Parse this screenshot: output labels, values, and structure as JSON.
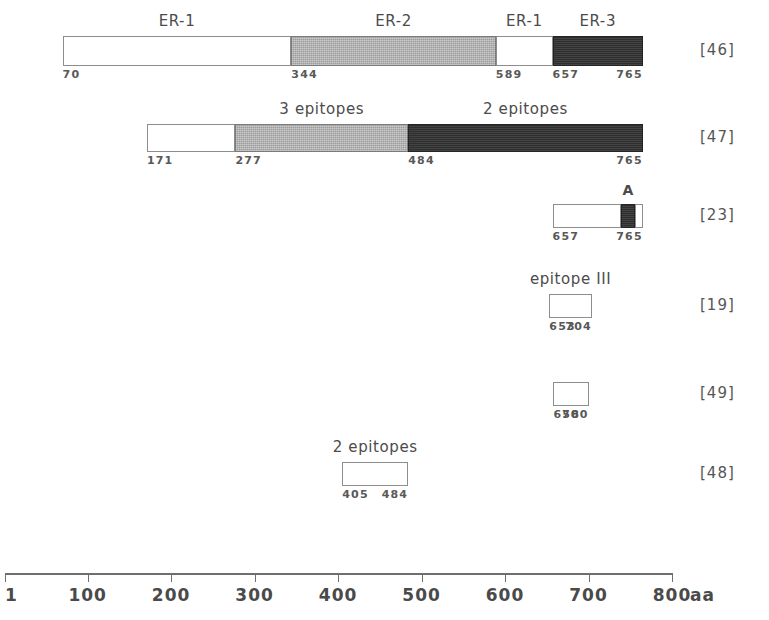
{
  "figure": {
    "axis": {
      "unit_label": "aa",
      "min": 1,
      "max": 800,
      "ticks": [
        {
          "value": 1,
          "label": "1"
        },
        {
          "value": 100,
          "label": "100"
        },
        {
          "value": 200,
          "label": "200"
        },
        {
          "value": 300,
          "label": "300"
        },
        {
          "value": 400,
          "label": "400"
        },
        {
          "value": 500,
          "label": "500"
        },
        {
          "value": 600,
          "label": "600"
        },
        {
          "value": 700,
          "label": "700"
        },
        {
          "value": 800,
          "label": "800"
        }
      ]
    },
    "colors": {
      "empty": "#ffffff",
      "gray": "#9c9c9c",
      "dark": "#2e2e2e",
      "outline": "#8d8d8d",
      "text": "#4a4a4a"
    },
    "rows": [
      {
        "reference": "[46]",
        "start": 70,
        "end": 765,
        "boundary_labels": [
          "70",
          "344",
          "589",
          "657",
          "765"
        ],
        "segments": [
          {
            "label": "ER-1",
            "start": 70,
            "end": 344,
            "fill": "empty"
          },
          {
            "label": "ER-2",
            "start": 344,
            "end": 589,
            "fill": "gray"
          },
          {
            "label": "ER-1",
            "start": 589,
            "end": 657,
            "fill": "empty"
          },
          {
            "label": "ER-3",
            "start": 657,
            "end": 765,
            "fill": "dark"
          }
        ]
      },
      {
        "reference": "[47]",
        "start": 171,
        "end": 765,
        "boundary_labels": [
          "171",
          "277",
          "484",
          "765"
        ],
        "segments": [
          {
            "label": "",
            "start": 171,
            "end": 277,
            "fill": "empty"
          },
          {
            "label": "3 epitopes",
            "start": 277,
            "end": 484,
            "fill": "gray"
          },
          {
            "label": "2 epitopes",
            "start": 484,
            "end": 765,
            "fill": "dark"
          }
        ]
      },
      {
        "reference": "[23]",
        "start": 657,
        "end": 765,
        "boundary_labels": [
          "657",
          "765"
        ],
        "segments": [
          {
            "label": "",
            "start": 657,
            "end": 739,
            "fill": "empty"
          },
          {
            "label": "A",
            "start": 739,
            "end": 756,
            "fill": "dark"
          },
          {
            "label": "",
            "start": 756,
            "end": 765,
            "fill": "empty"
          }
        ]
      },
      {
        "reference": "[19]",
        "start": 653,
        "end": 704,
        "boundary_labels": [
          "653",
          "704"
        ],
        "segments": [
          {
            "label": "epitope III",
            "start": 653,
            "end": 704,
            "fill": "empty"
          }
        ]
      },
      {
        "reference": "[49]",
        "start": 658,
        "end": 700,
        "boundary_labels": [
          "658",
          "700"
        ],
        "segments": [
          {
            "label": "",
            "start": 658,
            "end": 700,
            "fill": "empty"
          }
        ]
      },
      {
        "reference": "[48]",
        "start": 405,
        "end": 484,
        "boundary_labels": [
          "405",
          "484"
        ],
        "segments": [
          {
            "label": "2 epitopes",
            "start": 405,
            "end": 484,
            "fill": "empty"
          }
        ]
      }
    ]
  }
}
